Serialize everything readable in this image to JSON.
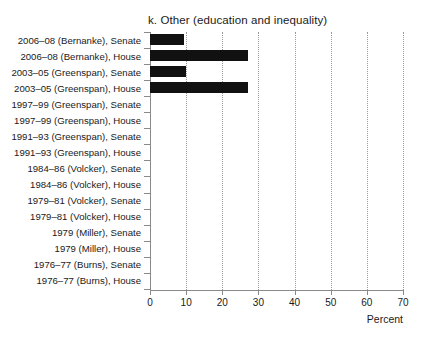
{
  "chart_data": {
    "type": "bar",
    "orientation": "horizontal",
    "title": "k. Other (education and inequality)",
    "xlabel": "Percent",
    "ylabel": "",
    "xlim": [
      0,
      70
    ],
    "xticks": [
      0,
      10,
      20,
      30,
      40,
      50,
      60,
      70
    ],
    "xticklabels": [
      "0",
      "10",
      "20",
      "30",
      "40",
      "50",
      "60",
      "70"
    ],
    "grid": "vertical-dotted",
    "legend": "none",
    "bar_color": "#111111",
    "categories": [
      "2006–08 (Bernanke), Senate",
      "2006–08 (Bernanke), House",
      "2003–05 (Greenspan), Senate",
      "2003–05 (Greenspan), House",
      "1997–99 (Greenspan), Senate",
      "1997–99 (Greenspan), House",
      "1991–93 (Greenspan), Senate",
      "1991–93 (Greenspan), House",
      "1984–86 (Volcker), Senate",
      "1984–86 (Volcker), House",
      "1979–81 (Volcker), Senate",
      "1979–81 (Volcker), House",
      "1979 (Miller), Senate",
      "1979 (Miller), House",
      "1976–77 (Burns), Senate",
      "1976–77 (Burns), House"
    ],
    "values": [
      9.5,
      27,
      10,
      27,
      0,
      0,
      0,
      0,
      0,
      0,
      0,
      0,
      0,
      0,
      0,
      0
    ]
  }
}
